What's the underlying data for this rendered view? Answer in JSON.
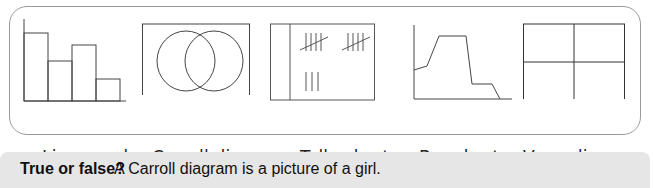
{
  "figures": [
    {
      "id": "fig-1",
      "depicts": "bar-chart-shape",
      "label": "Line graph"
    },
    {
      "id": "fig-2",
      "depicts": "venn-diagram-shape",
      "label": "Carroll diagram"
    },
    {
      "id": "fig-3",
      "depicts": "tally-chart-shape",
      "label": "Tally chart"
    },
    {
      "id": "fig-4",
      "depicts": "line-graph-shape",
      "label": "Bar chart"
    },
    {
      "id": "fig-5",
      "depicts": "carroll-diagram-shape",
      "label": "Venn diagram"
    }
  ],
  "question": {
    "prompt": "True or false?",
    "statement": "A Carroll diagram is a picture of a girl."
  },
  "colors": {
    "stroke": "#444444",
    "border": "#9a9a9a",
    "question_bg": "#e6e6e6"
  }
}
